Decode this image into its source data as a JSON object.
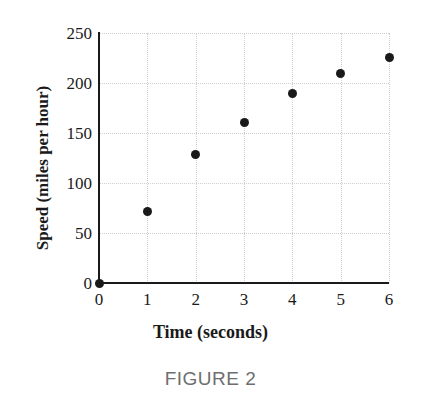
{
  "caption": "FIGURE 2",
  "chart_data": {
    "type": "scatter",
    "title": "",
    "xlabel": "Time (seconds)",
    "ylabel": "Speed (miles per hour)",
    "x": [
      0,
      1,
      2,
      3,
      4,
      5,
      6
    ],
    "values": [
      0,
      72,
      129,
      161,
      190,
      210,
      226
    ],
    "points": [
      {
        "x": 0,
        "y": 0
      },
      {
        "x": 1,
        "y": 72
      },
      {
        "x": 2,
        "y": 129
      },
      {
        "x": 3,
        "y": 161
      },
      {
        "x": 4,
        "y": 190
      },
      {
        "x": 5,
        "y": 210
      },
      {
        "x": 6,
        "y": 226
      }
    ],
    "xlim": [
      0,
      6
    ],
    "ylim": [
      0,
      250
    ],
    "xticks": [
      0,
      1,
      2,
      3,
      4,
      5,
      6
    ],
    "yticks": [
      0,
      50,
      100,
      150,
      200,
      250
    ],
    "xtick_labels": [
      "0",
      "1",
      "2",
      "3",
      "4",
      "5",
      "6"
    ],
    "ytick_labels": [
      "0",
      "50",
      "100",
      "150",
      "200",
      "250"
    ],
    "grid": true,
    "legend": false,
    "marker_color": "#1a1a1a",
    "axis_color": "#1a1a1a",
    "grid_color": "#cfcfcf",
    "caption_color": "#6e6e6e"
  }
}
